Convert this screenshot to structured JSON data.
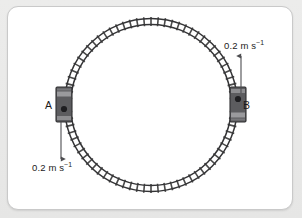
{
  "figure": {
    "panel": {
      "background_color": "#ffffff",
      "border_color": "#c9c9c9",
      "outer_background_color": "#e9e9e9"
    }
  },
  "track": {
    "shape": "circle",
    "center_x": 151,
    "center_y": 105,
    "outer_radius": 87,
    "inner_radius": 80,
    "rail_color": "#3a3a3a",
    "tie_color": "#4a4a4a",
    "tie_count": 76
  },
  "trains": [
    {
      "id": "A",
      "label": "A",
      "label_x": 45,
      "label_y": 100,
      "position_x": 64,
      "position_y": 105,
      "body_color": "#59595c",
      "band_color": "#8a8a8d",
      "window_color": "#222225",
      "direction": "down",
      "window_offset": "bottom"
    },
    {
      "id": "B",
      "label": "B",
      "label_x": 243,
      "label_y": 100,
      "position_x": 238,
      "position_y": 105,
      "body_color": "#59595c",
      "band_color": "#8a8a8d",
      "window_color": "#222225",
      "direction": "up",
      "window_offset": "top"
    }
  ],
  "velocity_arrows": [
    {
      "id": "arrow-b-up",
      "direction": "up",
      "x": 241,
      "from_y": 93,
      "to_y": 56,
      "color": "#555558",
      "label": "0.2 m s",
      "label_exponent": "−1",
      "label_full": "0.2 m s⁻¹",
      "label_x": 224,
      "label_y": 41
    },
    {
      "id": "arrow-a-down",
      "direction": "down",
      "x": 61,
      "from_y": 122,
      "to_y": 159,
      "color": "#555558",
      "label": "0.2 m s",
      "label_exponent": "−1",
      "label_full": "0.2 m s⁻¹",
      "label_x": 32,
      "label_y": 163
    }
  ],
  "labels": {
    "speed_value": "0.2 m s",
    "speed_exponent": "−1",
    "car_a": "A",
    "car_b": "B"
  }
}
